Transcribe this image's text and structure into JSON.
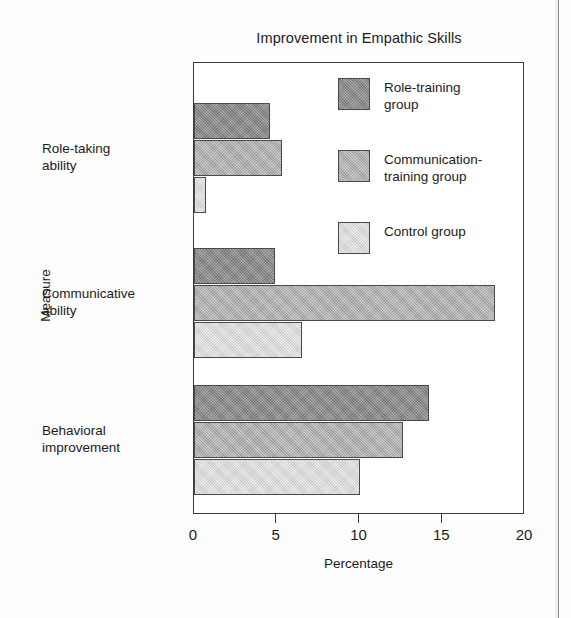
{
  "chart_data": {
    "type": "bar",
    "orientation": "horizontal",
    "title": "Improvement in Empathic Skills",
    "xlabel": "Percentage",
    "ylabel": "Measure",
    "categories": [
      "Role-taking\nability",
      "Communicative\nability",
      "Behavioral\nimprovement"
    ],
    "series": [
      {
        "name": "Role-training\ngroup",
        "color": "#8c8c8c",
        "values": [
          4.6,
          4.9,
          14.2
        ]
      },
      {
        "name": "Communication-\ntraining group",
        "color": "#b3b3b3",
        "values": [
          5.3,
          18.2,
          12.6
        ]
      },
      {
        "name": "Control group",
        "color": "#dedede",
        "values": [
          0.7,
          6.5,
          10.0
        ]
      }
    ],
    "xlim": [
      0,
      20
    ],
    "xticks": [
      0,
      5,
      10,
      15,
      20
    ],
    "xtick_labels": [
      "0",
      "5",
      "10",
      "15",
      "20"
    ],
    "grid": false,
    "legend_position": "upper right inside"
  },
  "legend": {
    "items": [
      {
        "label": "Role-training\ngroup"
      },
      {
        "label": "Communication-\ntraining group"
      },
      {
        "label": "Control group"
      }
    ]
  },
  "axis": {
    "y_title": "Measure",
    "x_title": "Percentage",
    "category_labels": [
      "Role-taking\nability",
      "Communicative\nability",
      "Behavioral\nimprovement"
    ],
    "tick_labels": [
      "0",
      "5",
      "10",
      "15",
      "20"
    ]
  },
  "title": "Improvement in Empathic Skills"
}
